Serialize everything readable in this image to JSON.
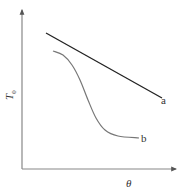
{
  "chart_data": {
    "type": "line",
    "title": "",
    "xlabel": "θ",
    "ylabel": "T0",
    "ylabel_base": "T",
    "ylabel_sub": "0",
    "grid": false,
    "axis_ticks": false,
    "legend": "inline labels at line ends",
    "series": [
      {
        "name": "a",
        "shape": "straight line, linearly decreasing",
        "color": "#222222",
        "points": [
          [
            46,
            33
          ],
          [
            162,
            98
          ]
        ]
      },
      {
        "name": "b",
        "shape": "sigmoid-like decreasing curve, flat start, steep drop, flattening tail",
        "color": "#777777",
        "points": [
          [
            53,
            51
          ],
          [
            63,
            55
          ],
          [
            72,
            65
          ],
          [
            80,
            80
          ],
          [
            88,
            100
          ],
          [
            96,
            118
          ],
          [
            105,
            130
          ],
          [
            118,
            136
          ],
          [
            139,
            138
          ]
        ]
      }
    ],
    "series_labels": [
      "a",
      "b"
    ],
    "note": "Qualitative schematic; axes have no numeric ticks. Points are pixel coordinates."
  },
  "axes": {
    "x_label": "θ",
    "y_label_base": "T",
    "y_label_sub": "0"
  },
  "labels": {
    "a": "a",
    "b": "b"
  },
  "colors": {
    "axis": "#888888",
    "series_a": "#222222",
    "series_b": "#777777"
  }
}
